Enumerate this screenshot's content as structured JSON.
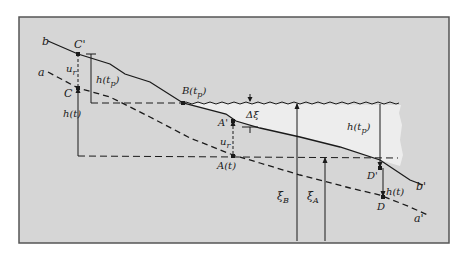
{
  "figure": {
    "colors": {
      "page_background": "#ffffff",
      "frame_background": "#d6d6d6",
      "frame_border": "#555555",
      "water_fill": "#ededed",
      "line": "#1a1a1a"
    },
    "line_labels": {
      "b": "b",
      "b_prime": "b'",
      "a": "a",
      "a_prime": "a'"
    },
    "points": {
      "C_upper": "C'",
      "C_lower": "C",
      "B": "B(t",
      "B_sub": "p",
      "B_close": ")",
      "A_prime": "A'",
      "A": "A(t)",
      "D_prime": "D'",
      "D": "D"
    },
    "quantities": {
      "u_r": "u",
      "u_r_sub": "r",
      "h_tp": "h(t",
      "h_tp_sub": "p",
      "h_tp_close": ")",
      "h_t": "h(t)",
      "delta_xi": "Δξ",
      "xi_B": "ξ",
      "xi_B_sub": "B",
      "xi_A": "ξ",
      "xi_A_sub": "A"
    }
  }
}
